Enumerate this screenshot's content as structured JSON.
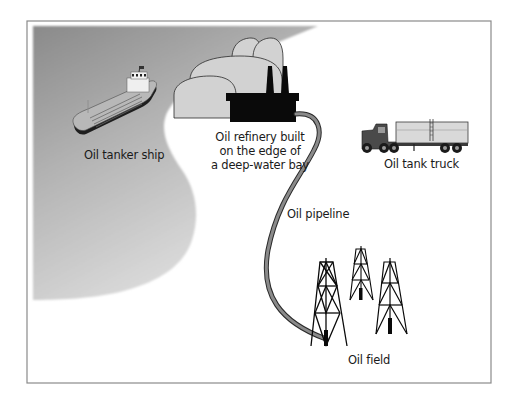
{
  "diagram": {
    "type": "illustration",
    "colors": {
      "frame": "#8a8a8a",
      "water_dark": "#8c8c8c",
      "water_light": "#d6d6d6",
      "land": "#ffffff",
      "refinery_tanks": "#cfcfcf",
      "refinery_building": "#0a0a0a",
      "pipeline": "#7a7a7a",
      "text": "#1a1a1a"
    },
    "labels": {
      "tanker": "Oil tanker ship",
      "refinery_line1": "Oil refinery built",
      "refinery_line2": "on the edge of",
      "refinery_line3": "a deep-water bay",
      "truck": "Oil tank truck",
      "pipeline": "Oil pipeline",
      "oil_field": "Oil field"
    },
    "elements": [
      {
        "name": "oil-tanker-ship",
        "label": "Oil tanker ship"
      },
      {
        "name": "oil-refinery",
        "label": "Oil refinery built on the edge of a deep-water bay"
      },
      {
        "name": "oil-tank-truck",
        "label": "Oil tank truck"
      },
      {
        "name": "oil-pipeline",
        "label": "Oil pipeline",
        "connects": [
          "oil-field",
          "oil-refinery"
        ]
      },
      {
        "name": "oil-field",
        "label": "Oil field",
        "derrick_count": 3
      }
    ]
  }
}
